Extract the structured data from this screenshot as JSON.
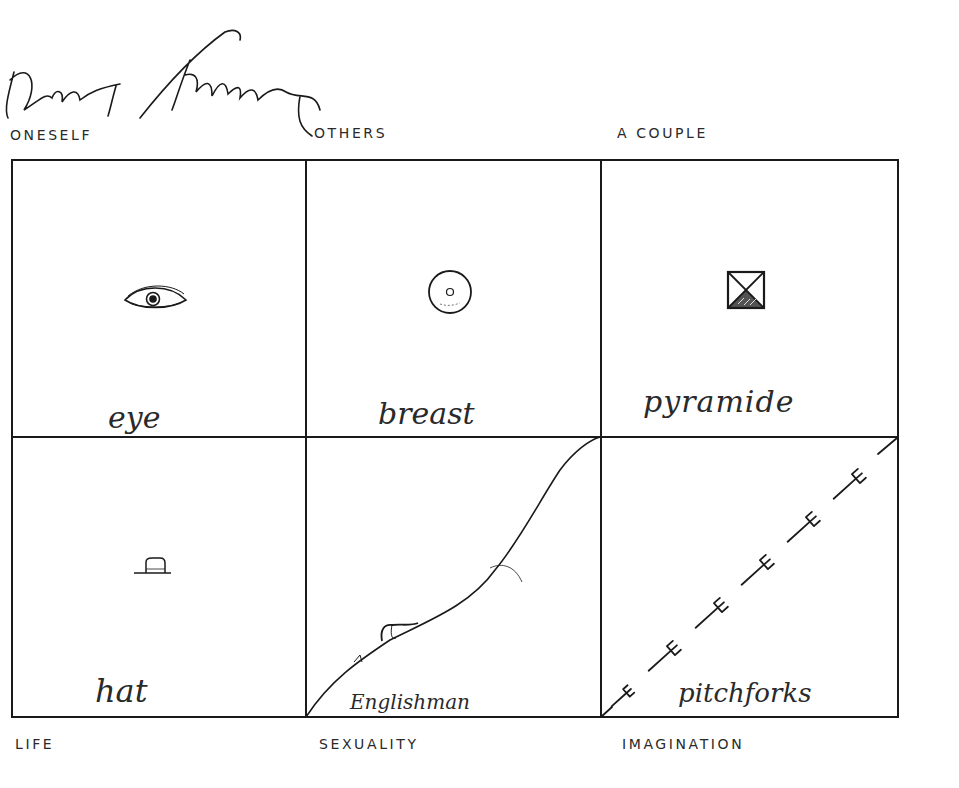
{
  "artwork": {
    "signature": "David Salle",
    "colors": {
      "ink": "#1a1a1a",
      "paper": "#ffffff",
      "label": "#2a2a2a"
    },
    "top_labels": [
      "ONESELF",
      "OTHERS",
      "A COUPLE"
    ],
    "bottom_labels": [
      "LIFE",
      "SEXUALITY",
      "IMAGINATION"
    ],
    "cells": [
      {
        "row": 0,
        "col": 0,
        "icon": "eye-icon",
        "caption": "eye"
      },
      {
        "row": 0,
        "col": 1,
        "icon": "breast-icon",
        "caption": "breast"
      },
      {
        "row": 0,
        "col": 2,
        "icon": "pyramid-icon",
        "caption": "pyramide"
      },
      {
        "row": 1,
        "col": 0,
        "icon": "hat-icon",
        "caption": "hat"
      },
      {
        "row": 1,
        "col": 1,
        "icon": "hillside-curve-icon",
        "caption": "Englishman"
      },
      {
        "row": 1,
        "col": 2,
        "icon": "pitchfork-icon",
        "caption": "pitchforks"
      }
    ]
  }
}
